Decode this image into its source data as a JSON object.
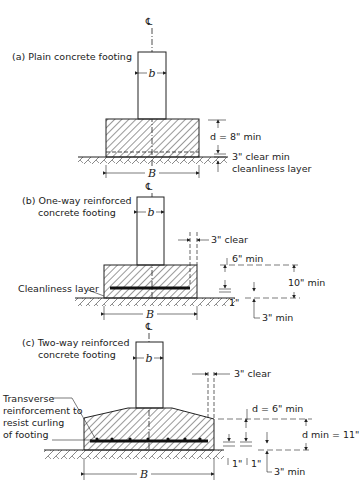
{
  "diagram": {
    "centerline_symbol": "℄",
    "colors": {
      "ink": "#222222",
      "background": "#ffffff"
    },
    "panels": [
      {
        "id": "a",
        "title": "(a) Plain concrete footing",
        "column_width_label": "b",
        "footing_width_label": "B",
        "depth_label": "d = 8\" min",
        "clear_label": "3\" clear min",
        "layer_label": "cleanliness layer"
      },
      {
        "id": "b",
        "title_line1": "(b) One-way reinforced",
        "title_line2": "concrete footing",
        "column_width_label": "b",
        "footing_width_label": "B",
        "edge_clear_label": "3\" clear",
        "layer_label": "Cleanliness layer",
        "top_cover_label": "6\" min",
        "total_depth_label": "10\" min",
        "bottom_label": "1\"",
        "cover_label": "3\" min"
      },
      {
        "id": "c",
        "title_line1": "(c) Two-way reinforced",
        "title_line2": "concrete footing",
        "column_width_label": "b",
        "footing_width_label": "B",
        "edge_clear_label": "3\" clear",
        "transverse_line1": "Transverse",
        "transverse_line2": "reinforcement to",
        "transverse_line3": "resist curling",
        "transverse_line4": "of footing",
        "depth_label": "d = 6\" min",
        "total_depth_label": "d min = 11\"",
        "bottom_label_1": "1\"",
        "bottom_label_2": "1\"",
        "cover_label": "3\" min"
      }
    ]
  }
}
